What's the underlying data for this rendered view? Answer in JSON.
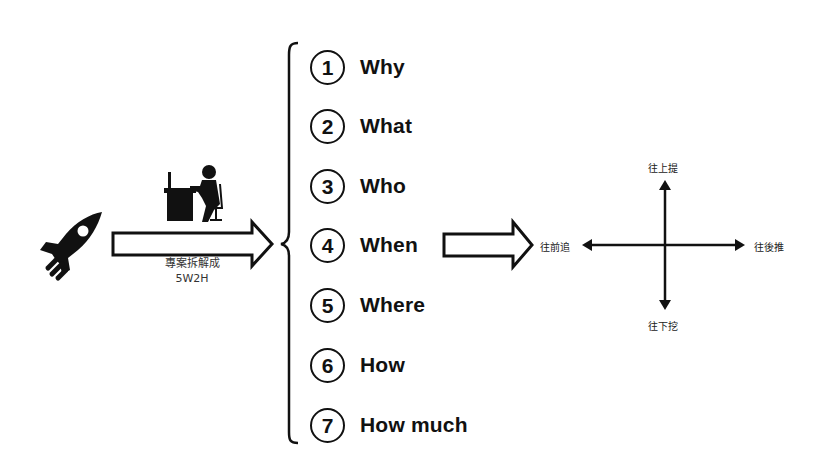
{
  "diagram": {
    "left": {
      "rocket_icon": "rocket-icon",
      "worker_icon": "person-at-desk-icon",
      "arrow_caption_line1": "專案拆解成",
      "arrow_caption_line2": "5W2H"
    },
    "list": {
      "items": [
        {
          "num": "1",
          "label": "Why"
        },
        {
          "num": "2",
          "label": "What"
        },
        {
          "num": "3",
          "label": "Who"
        },
        {
          "num": "4",
          "label": "When"
        },
        {
          "num": "5",
          "label": "Where"
        },
        {
          "num": "6",
          "label": "How"
        },
        {
          "num": "7",
          "label": "How much"
        }
      ]
    },
    "axes": {
      "up": "往上提",
      "down": "往下挖",
      "left": "往前追",
      "right": "往後推"
    },
    "colors": {
      "ink": "#111111",
      "background": "#ffffff"
    }
  }
}
